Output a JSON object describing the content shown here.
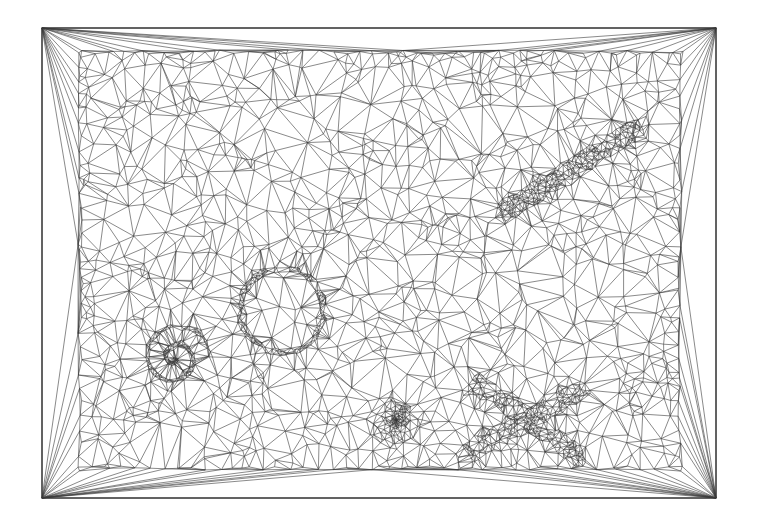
{
  "diagram": {
    "type": "delaunay-triangulation-mesh",
    "canvas": {
      "width": 757,
      "height": 530,
      "background": "#ffffff"
    },
    "stroke_color": "#3a3a3a",
    "outer_frame": {
      "x0": 42,
      "y0": 28,
      "x1": 716,
      "y1": 498
    },
    "inner_region": {
      "x0": 78,
      "y0": 50,
      "x1": 682,
      "y1": 470
    },
    "features": [
      {
        "name": "ring",
        "shape": "annulus",
        "cx": 282,
        "cy": 310,
        "r": 42,
        "density": "high"
      },
      {
        "name": "spiral",
        "shape": "spiral",
        "cx": 175,
        "cy": 358,
        "r": 36,
        "density": "high"
      },
      {
        "name": "slanted-bar",
        "shape": "band",
        "x0": 500,
        "y0": 215,
        "x1": 642,
        "y1": 125,
        "width": 22,
        "density": "high"
      },
      {
        "name": "dense-point",
        "shape": "point-cluster",
        "cx": 396,
        "cy": 420,
        "r": 30,
        "density": "very-high"
      },
      {
        "name": "cross",
        "shape": "x",
        "cx": 528,
        "cy": 420,
        "arm": 70,
        "width": 22,
        "density": "high"
      }
    ]
  }
}
